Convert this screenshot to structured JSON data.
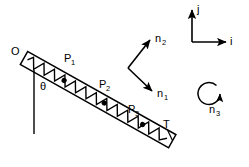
{
  "figure": {
    "background_color": "#ffffff",
    "stroke_color": "#000000",
    "width": 249,
    "height": 167
  },
  "beam": {
    "name": "flexible-spring-beam",
    "pivot_label": "O",
    "tip_label": "T",
    "angle_label": "θ",
    "inclination_deg_from_vertical": 57,
    "mass_labels": [
      "P",
      "P",
      "P"
    ],
    "mass_subscripts": [
      "1",
      "2",
      "3"
    ],
    "mass_point_count": 3,
    "spring_coil_count": 11
  },
  "inertial_frame": {
    "name": "inertial-reference-frame",
    "axes": [
      {
        "label": "j",
        "direction": "up"
      },
      {
        "label": "i",
        "direction": "right"
      }
    ]
  },
  "body_frame": {
    "name": "body-fixed-frame",
    "axes": [
      {
        "label": "n",
        "subscript": "2",
        "direction": "up-right"
      },
      {
        "label": "n",
        "subscript": "1",
        "direction": "down-right"
      }
    ]
  },
  "rotation": {
    "name": "angular-rotation-indicator",
    "label": "n",
    "subscript": "3",
    "sense": "counterclockwise"
  }
}
